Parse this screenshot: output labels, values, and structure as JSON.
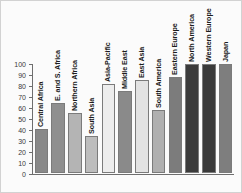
{
  "chart_data": {
    "type": "bar",
    "title": "",
    "subtitle": "",
    "xlabel": "",
    "ylabel": "",
    "ylim": [
      0,
      100
    ],
    "yticks": [
      "0",
      "10",
      "20",
      "30",
      "40",
      "50",
      "60",
      "70",
      "80",
      "90",
      "100"
    ],
    "grid": false,
    "legend": "none",
    "orientation": "vertical",
    "label_rotation": 90,
    "categories": [
      "Central Africa",
      "E. and S. Africa",
      "Northern Africa",
      "South Asia",
      "Asia-Pacific",
      "Middle East",
      "East Asia",
      "South America",
      "Eastern Europe",
      "North America",
      "Western Europe",
      "Japan"
    ],
    "values": [
      40,
      64,
      55,
      34,
      81,
      75,
      85,
      57,
      87,
      99,
      99,
      99
    ],
    "bar_colors": [
      "#898989",
      "#8f8f8f",
      "#b4b4b4",
      "#bdbdbd",
      "#ededed",
      "#8a8a8a",
      "#e3e3e3",
      "#b0b0b0",
      "#7c7c7c",
      "#3b3b3b",
      "#3a3a3a",
      "#7e7e7e"
    ]
  },
  "axes": {
    "axis_color": "#6e6e6e",
    "background": "#fbfbfb"
  }
}
